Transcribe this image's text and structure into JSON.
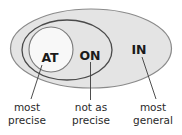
{
  "diagram": {
    "title": "",
    "type": "nested-sets",
    "colors": {
      "outer_fill": "#e4e4e4",
      "outer_stroke": "#8a8a8a",
      "middle_fill": "#e4e4e4",
      "middle_stroke": "#4a4a4a",
      "inner_fill": "#f8f8f8",
      "inner_stroke": "#7a7a7a",
      "leader_line": "#3a3a3a",
      "text": "#1a1a1a"
    },
    "sets": [
      {
        "id": "at",
        "label": "AT",
        "caption_line1": "most",
        "caption_line2": "precise"
      },
      {
        "id": "on",
        "label": "ON",
        "caption_line1": "not as",
        "caption_line2": "precise"
      },
      {
        "id": "in",
        "label": "IN",
        "caption_line1": "most",
        "caption_line2": "general"
      }
    ]
  }
}
